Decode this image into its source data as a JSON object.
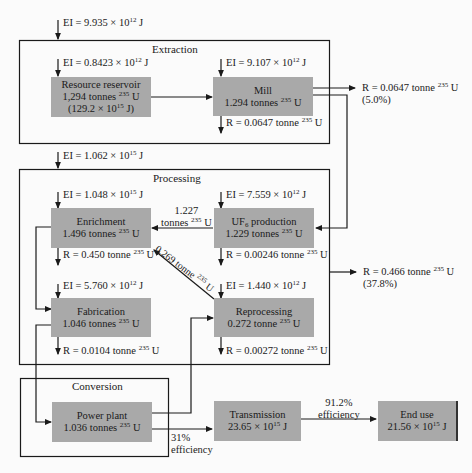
{
  "sections": {
    "extraction": {
      "title": "Extraction",
      "ei_in": "EI = 9.935 × 10",
      "ei_in_exp": "12",
      "ei_in_unit": " J"
    },
    "processing": {
      "title": "Processing",
      "ei_in": "EI = 1.062 × 10",
      "ei_in_exp": "15",
      "ei_in_unit": " J"
    },
    "conversion": {
      "title": "Conversion"
    }
  },
  "nodes": {
    "resource_reservoir": {
      "name": "Resource reservoir",
      "amount": "1,294 tonnes",
      "iso": "235",
      "el": " U",
      "energy": "(129.2 × 10",
      "energy_exp": "15",
      "energy_unit": " J)",
      "ei": "EI = 0.8423 × 10",
      "ei_exp": "12",
      "ei_unit": " J"
    },
    "mill": {
      "name": "Mill",
      "amount": "1.294 tonnes",
      "iso": "235",
      "el": " U",
      "ei": "EI = 9.107 × 10",
      "ei_exp": "12",
      "ei_unit": " J",
      "r": "R = 0.0647 tonne",
      "r_iso": "235",
      "r_el": " U"
    },
    "enrichment": {
      "name": "Enrichment",
      "amount": "1.496 tonnes",
      "iso": "235",
      "el": " U",
      "ei": "EI = 1.048 × 10",
      "ei_exp": "15",
      "ei_unit": " J",
      "r": "R = 0.450 tonne",
      "r_iso": "235",
      "r_el": " U"
    },
    "uf6_production": {
      "name_a": "UF",
      "name_sub": "6",
      "name_b": " production",
      "amount": "1.229 tonnes",
      "iso": "235",
      "el": " U",
      "ei": "EI = 7.559 × 10",
      "ei_exp": "12",
      "ei_unit": " J",
      "r": "R = 0.00246 tonne",
      "r_iso": "235",
      "r_el": " U"
    },
    "fabrication": {
      "name": "Fabrication",
      "amount": "1.046 tonnes",
      "iso": "235",
      "el": " U",
      "ei": "EI = 5.760 × 10",
      "ei_exp": "12",
      "ei_unit": " J",
      "r": "R = 0.0104 tonne",
      "r_iso": "235",
      "r_el": " U"
    },
    "reprocessing": {
      "name": "Reprocessing",
      "amount": "0.272 tonne",
      "iso": "235",
      "el": " U",
      "ei": "EI = 1.440 × 10",
      "ei_exp": "12",
      "ei_unit": " J",
      "r": "R = 0.00272 tonne",
      "r_iso": "235",
      "r_el": " U"
    },
    "power_plant": {
      "name": "Power plant",
      "amount": "1.036 tonnes",
      "iso": "235",
      "el": " U"
    },
    "transmission": {
      "name": "Transmission",
      "energy": "23.65 × 10",
      "energy_exp": "15",
      "energy_unit": " J"
    },
    "end_use": {
      "name": "End use",
      "energy": "21.56 × 10",
      "energy_exp": "15",
      "energy_unit": " J"
    }
  },
  "flows": {
    "uf6_to_enrichment": {
      "line1": "1.227",
      "line2": "tonnes",
      "iso": "235",
      "el": " U"
    },
    "reprocessing_to_enrichment": {
      "label": "0.269 tonne",
      "iso": "235",
      "el": " U"
    },
    "extraction_residual": {
      "r": "R = 0.0647 tonne",
      "iso": "235",
      "el": " U",
      "pct": "(5.0%)"
    },
    "processing_residual": {
      "r": "R = 0.466 tonne",
      "iso": "235",
      "el": " U",
      "pct": "(37.8%)"
    },
    "power_to_transmission": {
      "line1": "31%",
      "line2": "efficiency"
    },
    "transmission_to_end": {
      "line1": "91.2%",
      "line2": "efficiency"
    }
  }
}
